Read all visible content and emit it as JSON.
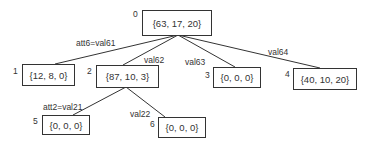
{
  "diagram": {
    "type": "decision-tree",
    "nodes": [
      {
        "id": "0",
        "index_label": "0",
        "value": "{63, 17, 20}"
      },
      {
        "id": "1",
        "index_label": "1",
        "value": "{12, 8, 0}"
      },
      {
        "id": "2",
        "index_label": "2",
        "value": "{87, 10, 3}"
      },
      {
        "id": "3",
        "index_label": "3",
        "value": "{0, 0, 0}"
      },
      {
        "id": "4",
        "index_label": "4",
        "value": "{40, 10, 20}"
      },
      {
        "id": "5",
        "index_label": "5",
        "value": "{0, 0, 0}"
      },
      {
        "id": "6",
        "index_label": "6",
        "value": "{0, 0, 0}"
      }
    ],
    "edges": [
      {
        "from": "0",
        "to": "1",
        "label": "att6=val61"
      },
      {
        "from": "0",
        "to": "2",
        "label": "val62"
      },
      {
        "from": "0",
        "to": "3",
        "label": "val63"
      },
      {
        "from": "0",
        "to": "4",
        "label": "val64"
      },
      {
        "from": "2",
        "to": "5",
        "label": "att2=val21"
      },
      {
        "from": "2",
        "to": "6",
        "label": "val22"
      }
    ]
  }
}
